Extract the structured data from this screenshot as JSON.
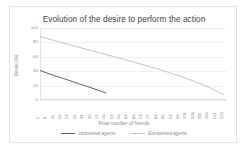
{
  "chart_data": {
    "type": "line",
    "title": "Evolution of the desire to perform the action",
    "xlabel": "Final number of friends",
    "ylabel": "Desire (%)",
    "ylim": [
      0,
      100
    ],
    "yticks": [
      100,
      80,
      60,
      40,
      20,
      0
    ],
    "xlim": [
      1,
      128
    ],
    "grid": true,
    "legend_position": "bottom",
    "xticks": [
      1,
      6,
      11,
      16,
      21,
      26,
      31,
      36,
      41,
      46,
      51,
      56,
      61,
      66,
      71,
      76,
      81,
      86,
      91,
      96,
      101,
      106,
      111,
      116,
      121,
      126
    ],
    "series": [
      {
        "name": "Introverted agents",
        "color": "#595959",
        "x": [
          1,
          3,
          5,
          7,
          9,
          11,
          13,
          15,
          17,
          19,
          21,
          23,
          25,
          27,
          29,
          31,
          33,
          35,
          37,
          39,
          41,
          43,
          45,
          46
        ],
        "values": [
          41,
          39.5,
          38,
          36.6,
          35.2,
          33.8,
          32.3,
          31.2,
          29.8,
          28.4,
          27.1,
          25.6,
          24.3,
          22.9,
          21.5,
          20.2,
          18.8,
          17.4,
          16.1,
          14.6,
          13.2,
          11.8,
          10.2,
          9.4
        ]
      },
      {
        "name": "Extraverted agents",
        "color": "#c2c2c2",
        "x": [
          1,
          6,
          11,
          16,
          21,
          26,
          31,
          36,
          41,
          46,
          51,
          56,
          61,
          66,
          71,
          76,
          81,
          86,
          91,
          96,
          101,
          106,
          111,
          116,
          121,
          126
        ],
        "values": [
          88,
          85.2,
          82.4,
          79.6,
          76.8,
          74.1,
          71.3,
          68.6,
          65.8,
          63.1,
          60.3,
          57.5,
          54.7,
          51.9,
          49,
          46,
          43,
          39.9,
          36.6,
          33.2,
          29.6,
          25.8,
          21.7,
          17.3,
          12.5,
          7.2
        ]
      }
    ]
  }
}
